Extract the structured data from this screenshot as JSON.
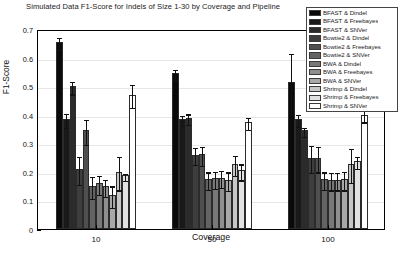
{
  "chart_data": {
    "type": "bar",
    "title": "Simulated Data F1-Score for Indels of Size 1-30 by Coverage and Pipeline",
    "xlabel": "Coverage",
    "ylabel": "F1-Score",
    "categories": [
      "10",
      "50",
      "100"
    ],
    "ylim": [
      0,
      0.7
    ],
    "yticks": [
      "0",
      "0.1",
      "0.2",
      "0.3",
      "0.4",
      "0.5",
      "0.6",
      "0.7"
    ],
    "ytick_values": [
      0,
      0.1,
      0.2,
      0.3,
      0.4,
      0.5,
      0.6,
      0.7
    ],
    "grid": true,
    "legend_position": "upper right",
    "series": [
      {
        "name": "BFAST & Dindel",
        "color": "#0a0a0a",
        "values": [
          0.655,
          0.545,
          0.515
        ],
        "errors": [
          0.022,
          0.018,
          0.105
        ]
      },
      {
        "name": "BFAST & Freebayes",
        "color": "#191919",
        "values": [
          0.385,
          0.385,
          0.385
        ],
        "errors": [
          0.025,
          0.018,
          0.022
        ]
      },
      {
        "name": "BFAST & SNVer",
        "color": "#2b2b2b",
        "values": [
          0.5,
          0.39,
          0.345
        ],
        "errors": [
          0.022,
          0.018,
          0.015
        ]
      },
      {
        "name": "Bowtie2 & Dindel",
        "color": "#3d3d3d",
        "values": [
          0.21,
          0.26,
          0.25
        ],
        "errors": [
          0.048,
          0.03,
          0.048
        ]
      },
      {
        "name": "Bowtie2 & Freebayes",
        "color": "#4f4f4f",
        "values": [
          0.345,
          0.262,
          0.25
        ],
        "errors": [
          0.045,
          0.033,
          0.045
        ]
      },
      {
        "name": "Bowtie2 & SNVer",
        "color": "#636363",
        "values": [
          0.15,
          0.175,
          0.175
        ],
        "errors": [
          0.038,
          0.03,
          0.03
        ]
      },
      {
        "name": "BWA & Dindel",
        "color": "#787878",
        "values": [
          0.16,
          0.178,
          0.172
        ],
        "errors": [
          0.033,
          0.03,
          0.03
        ]
      },
      {
        "name": "BWA & Freebayes",
        "color": "#8f8f8f",
        "values": [
          0.15,
          0.18,
          0.172
        ],
        "errors": [
          0.03,
          0.03,
          0.03
        ]
      },
      {
        "name": "BWA & SNVer",
        "color": "#a8a8a8",
        "values": [
          0.118,
          0.172,
          0.175
        ],
        "errors": [
          0.038,
          0.033,
          0.033
        ]
      },
      {
        "name": "Shrimp & Dindel",
        "color": "#c7c7c7",
        "values": [
          0.2,
          0.228,
          0.228
        ],
        "errors": [
          0.058,
          0.035,
          0.06
        ]
      },
      {
        "name": "Shrimp & Freebayes",
        "color": "#e2e2e2",
        "values": [
          0.188,
          0.205,
          0.238
        ],
        "errors": [
          0.012,
          0.028,
          0.02
        ]
      },
      {
        "name": "Shrimp & SNVer",
        "color": "#ffffff",
        "values": [
          0.47,
          0.375,
          0.4
        ],
        "errors": [
          0.04,
          0.02,
          0.02
        ]
      }
    ]
  },
  "legend": {
    "items": [
      "BFAST & Dindel",
      "BFAST & Freebayes",
      "BFAST & SNVer",
      "Bowtie2 & Dindel",
      "Bowtie2 & Freebayes",
      "Bowtie2 & SNVer",
      "BWA & Dindel",
      "BWA & Freebayes",
      "BWA & SNVer",
      "Shrimp & Dindel",
      "Shrimp & Freebayes",
      "Shrimp & SNVer"
    ]
  }
}
